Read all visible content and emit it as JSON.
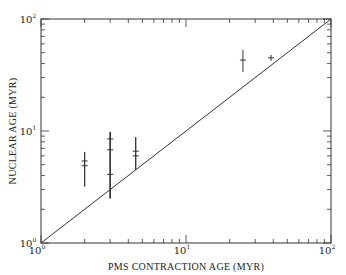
{
  "chart_data": {
    "type": "scatter",
    "title": "",
    "xlabel": "PMS CONTRACTION AGE (MYR)",
    "ylabel": "NUCLEAR AGE (MYR)",
    "xscale": "log",
    "yscale": "log",
    "xlim": [
      1,
      100
    ],
    "ylim": [
      1,
      100
    ],
    "x_tick_labels": [
      {
        "base": "10",
        "exp": "0",
        "value": 1
      },
      {
        "base": "10",
        "exp": "1",
        "value": 10
      },
      {
        "base": "10",
        "exp": "2",
        "value": 100
      }
    ],
    "y_tick_labels": [
      {
        "base": "10",
        "exp": "0",
        "value": 1
      },
      {
        "base": "10",
        "exp": "1",
        "value": 10
      },
      {
        "base": "10",
        "exp": "2",
        "value": 100
      }
    ],
    "grid": false,
    "legend": null,
    "reference_line": {
      "label": "one-to-one",
      "x": [
        1,
        100
      ],
      "y": [
        1,
        100
      ]
    },
    "series": [
      {
        "name": "stars",
        "points": [
          {
            "x": 2.0,
            "y": 5.4,
            "yerr_low": 3.2,
            "yerr_high": 6.5
          },
          {
            "x": 2.0,
            "y": 4.9,
            "yerr_low": 3.2,
            "yerr_high": 6.5
          },
          {
            "x": 3.0,
            "y": 8.5,
            "yerr_low": 2.5,
            "yerr_high": 9.8
          },
          {
            "x": 3.0,
            "y": 6.8,
            "yerr_low": 2.5,
            "yerr_high": 9.8
          },
          {
            "x": 3.0,
            "y": 4.1,
            "yerr_low": 2.5,
            "yerr_high": 9.8
          },
          {
            "x": 4.5,
            "y": 6.6,
            "yerr_low": 4.5,
            "yerr_high": 8.8
          },
          {
            "x": 4.5,
            "y": 6.0,
            "yerr_low": 4.5,
            "yerr_high": 8.8
          },
          {
            "x": 24.7,
            "y": 43,
            "yerr_low": 33.6,
            "yerr_high": 53
          },
          {
            "x": 38.6,
            "y": 45,
            "yerr_low": null,
            "yerr_high": null
          }
        ]
      }
    ]
  }
}
